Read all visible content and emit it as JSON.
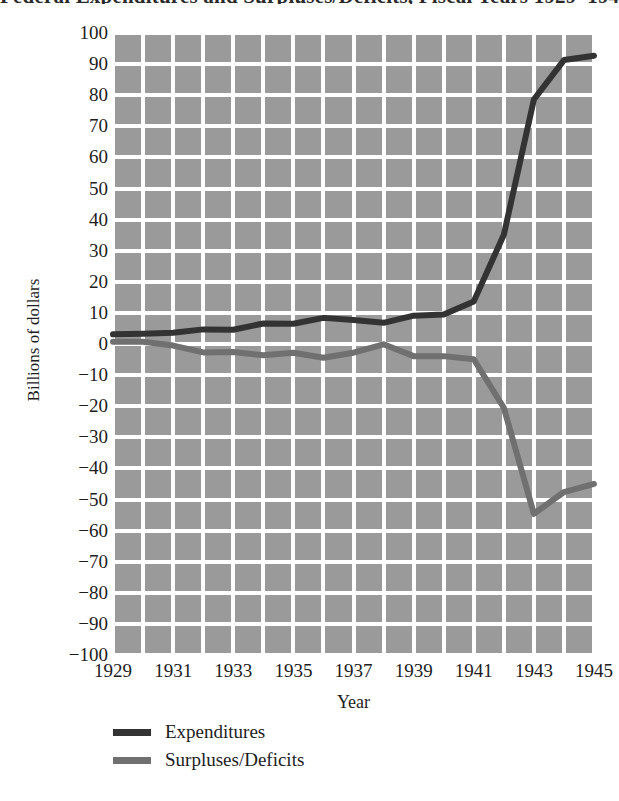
{
  "chart_data": {
    "type": "line",
    "title": "Federal Expenditures and Surpluses/Deficits, Fiscal Years 1929–1945",
    "xlabel": "Year",
    "ylabel": "Billions of dollars",
    "ylim": [
      -100,
      100
    ],
    "xlim": [
      1929,
      1945
    ],
    "ytick_step": 10,
    "xtick_step": 2,
    "grid": true,
    "legend_position": "bottom-left",
    "plot_background": "#9a9a9a",
    "gridline_color": "#ffffff",
    "x": [
      1929,
      1930,
      1931,
      1932,
      1933,
      1934,
      1935,
      1936,
      1937,
      1938,
      1939,
      1940,
      1941,
      1942,
      1943,
      1944,
      1945
    ],
    "ytick_labels": [
      "100",
      "90",
      "80",
      "70",
      "60",
      "50",
      "40",
      "30",
      "20",
      "10",
      "0",
      "−10",
      "−20",
      "−30",
      "−40",
      "−50",
      "−60",
      "−70",
      "−80",
      "−90",
      "−100"
    ],
    "xtick_labels": [
      "1929",
      "1931",
      "1933",
      "1935",
      "1937",
      "1939",
      "1941",
      "1943",
      "1945"
    ],
    "series": [
      {
        "name": "Expenditures",
        "color": "#333333",
        "values": [
          3.1,
          3.3,
          3.6,
          4.7,
          4.6,
          6.6,
          6.5,
          8.4,
          7.7,
          6.8,
          9.1,
          9.5,
          13.7,
          35.1,
          78.6,
          91.3,
          92.7
        ]
      },
      {
        "name": "Surpluses/Deficits",
        "color": "#707070",
        "values": [
          0.7,
          0.7,
          -0.5,
          -2.7,
          -2.6,
          -3.6,
          -2.8,
          -4.4,
          -2.8,
          -0.1,
          -3.9,
          -3.9,
          -4.9,
          -20.5,
          -54.6,
          -47.6,
          -45.0
        ]
      }
    ]
  },
  "axis": {
    "y_title": "Billions of dollars",
    "x_title": "Year"
  },
  "legend": {
    "items": [
      {
        "label": "Expenditures",
        "color": "#333333"
      },
      {
        "label": "Surpluses/Deficits",
        "color": "#707070"
      }
    ]
  }
}
